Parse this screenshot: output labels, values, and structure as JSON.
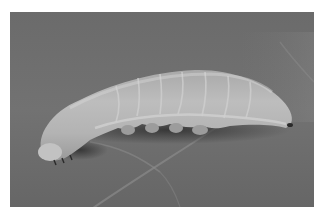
{
  "image": {
    "description": "Grayscale photograph of a pale caterpillar (larva) crawling on a leaf surface with visible leaf veins",
    "subject": "larva",
    "background": "leaf",
    "colors": {
      "frame": "#ffffff",
      "leaf_background": "#6f6f6f",
      "leaf_dark": "#5c5c5c",
      "leaf_vein": "#8a8a8a",
      "larva_body": "#b4b4b4",
      "larva_highlight": "#cfcfcf",
      "larva_shadow": "#3a3a3a"
    }
  }
}
